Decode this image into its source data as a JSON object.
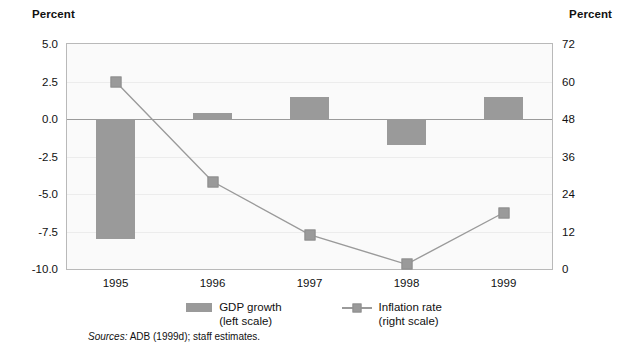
{
  "left_axis_caption": "Percent",
  "right_axis_caption": "Percent",
  "legend": {
    "bar": {
      "line1": "GDP growth",
      "line2": "(left scale)"
    },
    "line": {
      "line1": "Inflation rate",
      "line2": "(right scale)"
    }
  },
  "source": {
    "label": "Sources:",
    "text": "ADB (1999d); staff estimates."
  },
  "colors": {
    "series_gray": "#9a9a9a",
    "frame": "#b9b9b9",
    "plot_bg": "#fafafa",
    "gridline": "#ececec",
    "zeroline": "#9a9a9a"
  },
  "chart_data": {
    "type": "bar",
    "title": "",
    "xlabel": "",
    "ylabel": "Percent",
    "categories": [
      "1995",
      "1996",
      "1997",
      "1998",
      "1999"
    ],
    "grid": true,
    "legend_position": "bottom",
    "left_axis": {
      "label": "Percent",
      "ticks": [
        "5.0",
        "2.5",
        "0.0",
        "-2.5",
        "-5.0",
        "-7.5",
        "-10.0"
      ],
      "tick_values": [
        5.0,
        2.5,
        0.0,
        -2.5,
        -5.0,
        -7.5,
        -10.0
      ],
      "ylim": [
        -10.0,
        5.0
      ]
    },
    "right_axis": {
      "label": "Percent",
      "ticks": [
        "72",
        "60",
        "48",
        "36",
        "24",
        "12",
        "0"
      ],
      "tick_values": [
        72,
        60,
        48,
        36,
        24,
        12,
        0
      ],
      "ylim": [
        0,
        72
      ]
    },
    "series": [
      {
        "name": "GDP growth",
        "scale": "left",
        "type": "bar",
        "values": [
          -8.0,
          0.4,
          1.5,
          -1.7,
          1.5
        ]
      },
      {
        "name": "Inflation rate",
        "scale": "right",
        "type": "line",
        "values": [
          60,
          28,
          11,
          1.5,
          18
        ]
      }
    ]
  }
}
